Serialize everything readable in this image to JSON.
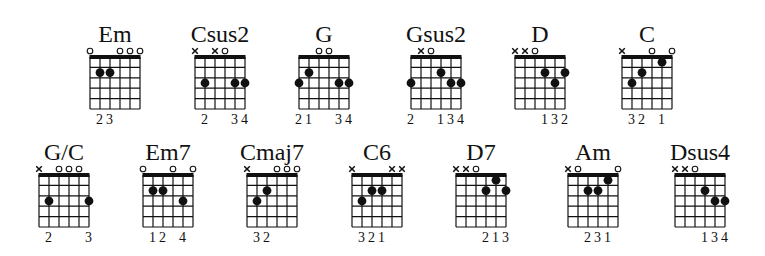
{
  "sheet": {
    "title": "Guitar chord chart",
    "colors": {
      "ink": "#111111",
      "background": "#ffffff"
    },
    "legend": {
      "x": "muted string",
      "o": "open string",
      "dot": "fretted note"
    },
    "rows": [
      {
        "chords": [
          {
            "name": "Em",
            "left": 90,
            "strings": [
              "o",
              2,
              2,
              "o",
              "o",
              "o"
            ],
            "fingers": [
              "",
              "2",
              "3",
              "",
              "",
              ""
            ]
          },
          {
            "name": "Csus2",
            "left": 195,
            "strings": [
              "x",
              3,
              "x",
              "o",
              3,
              3
            ],
            "fingers": [
              "",
              "2",
              "",
              "",
              "3",
              "4"
            ]
          },
          {
            "name": "G",
            "left": 299,
            "strings": [
              3,
              2,
              "o",
              "o",
              3,
              3
            ],
            "fingers": [
              "2",
              "1",
              "",
              "",
              "3",
              "4"
            ]
          },
          {
            "name": "Gsus2",
            "left": 411,
            "strings": [
              3,
              "x",
              "o",
              2,
              3,
              3
            ],
            "fingers": [
              "2",
              "",
              "",
              "1",
              "3",
              "4"
            ]
          },
          {
            "name": "D",
            "left": 515,
            "strings": [
              "x",
              "x",
              "o",
              2,
              3,
              2
            ],
            "fingers": [
              "",
              "",
              "",
              "1",
              "3",
              "2"
            ]
          },
          {
            "name": "C",
            "left": 622,
            "strings": [
              "x",
              3,
              2,
              "o",
              1,
              "o"
            ],
            "fingers": [
              "",
              "3",
              "2",
              "",
              "1",
              ""
            ]
          }
        ]
      },
      {
        "chords": [
          {
            "name": "G/C",
            "left": 39,
            "strings": [
              "x",
              3,
              "o",
              "o",
              "o",
              3
            ],
            "fingers": [
              "",
              "2",
              "",
              "",
              "",
              "3"
            ]
          },
          {
            "name": "Em7",
            "left": 143,
            "strings": [
              "o",
              2,
              2,
              "o",
              3,
              "o"
            ],
            "fingers": [
              "",
              "1",
              "2",
              "",
              "4",
              ""
            ]
          },
          {
            "name": "Cmaj7",
            "left": 247,
            "strings": [
              "x",
              3,
              2,
              "o",
              "o",
              "o"
            ],
            "fingers": [
              "",
              "3",
              "2",
              "",
              "",
              ""
            ]
          },
          {
            "name": "C6",
            "left": 352,
            "strings": [
              "x",
              3,
              2,
              2,
              "x",
              "x"
            ],
            "fingers": [
              "",
              "3",
              "2",
              "1",
              "",
              ""
            ]
          },
          {
            "name": "D7",
            "left": 456,
            "strings": [
              "x",
              "x",
              "o",
              2,
              1,
              2
            ],
            "fingers": [
              "",
              "",
              "",
              "2",
              "1",
              "3"
            ]
          },
          {
            "name": "Am",
            "left": 568,
            "strings": [
              "x",
              "o",
              2,
              2,
              1,
              "o"
            ],
            "fingers": [
              "",
              "",
              "2",
              "3",
              "1",
              ""
            ]
          },
          {
            "name": "Dsus4",
            "left": 675,
            "strings": [
              "x",
              "x",
              "o",
              2,
              3,
              3
            ],
            "fingers": [
              "",
              "",
              "",
              "1",
              "3",
              "4"
            ]
          }
        ]
      }
    ]
  }
}
